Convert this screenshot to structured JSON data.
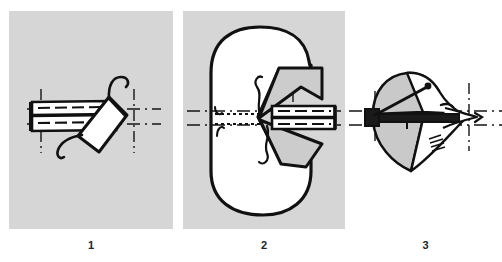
{
  "figure": {
    "background_color": "#ffffff",
    "panel_fill_gray": "#d6d6d6",
    "panel_fill_white": "#ffffff",
    "ink_color": "#111111",
    "shade_color": "#c9c9c9",
    "panels": [
      {
        "id": "panel-1",
        "caption": "1",
        "background": "gray",
        "description": "Shaded square plate with a horizontal hatched shaft assembly crossing the centerline; an angled quadrilateral flap attached at the right end with a hooked curved tail above and a second curl below; vertical and horizontal dash-dot centerlines.",
        "elements": [
          "horizontal-shaft",
          "angled-flap",
          "hook-curl-upper",
          "hook-curl-lower",
          "vertical-centerline-left",
          "vertical-centerline-right",
          "horizontal-centerline-upper",
          "horizontal-centerline-lower"
        ]
      },
      {
        "id": "panel-2",
        "caption": "2",
        "background": "gray",
        "description": "Large white rounded-rectangle form filling the shaded plate; a notch bites into the right side where two dark triangular wedges splay out from a central pivot point; a hatched shaft enters from the right along the centerline; dotted leader lines run left from the pivot; two wavy thread curls flank the pivot.",
        "elements": [
          "rounded-blob-outline",
          "upper-wedge",
          "lower-wedge",
          "horizontal-shaft",
          "dotted-leader-upper",
          "dotted-leader-lower",
          "thread-curl-upper",
          "thread-curl-lower",
          "vertical-centerline",
          "horizontal-centerline-upper",
          "horizontal-centerline-lower"
        ]
      },
      {
        "id": "panel-3",
        "caption": "3",
        "background": "white",
        "description": "Collapsed folded form shown in near end-on view: a gray-shaded leaf above and below a dark horizontal shaft, tapering to a pinched point at the right; fine hatch strokes at lower right; dash-dot vertical and horizontal centerlines.",
        "elements": [
          "upper-shaded-leaf",
          "lower-shaded-leaf",
          "horizontal-shaft",
          "tapered-tip",
          "hatch-marks",
          "vertical-centerline-left",
          "vertical-centerline-right",
          "horizontal-centerline-upper",
          "horizontal-centerline-lower"
        ]
      }
    ]
  }
}
